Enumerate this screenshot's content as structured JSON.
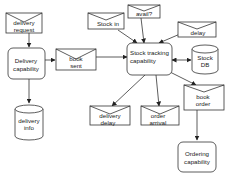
{
  "diagram": {
    "processes": {
      "delivery_capability": {
        "line1": "Delivery",
        "line2": "capability"
      },
      "stock_tracking": {
        "line1": "Stock tracking",
        "line2": "capability"
      },
      "ordering_capability": {
        "line1": "Ordering",
        "line2": "capability"
      }
    },
    "datastores": {
      "delivery_info": {
        "line1": "delivery",
        "line2": "info"
      },
      "stock_db": {
        "line1": "Stock",
        "line2": "DB"
      }
    },
    "messages": {
      "delivery_request": {
        "line1": "delivery",
        "line2": "request"
      },
      "book_sent": {
        "line1": "book",
        "line2": "sent"
      },
      "stock_in": {
        "line1": "Stock in"
      },
      "avail": {
        "line1": "avail?"
      },
      "delay": {
        "line1": "delay"
      },
      "delivery_delay": {
        "line1": "delivery",
        "line2": "delay"
      },
      "order_arrival": {
        "line1": "order",
        "line2": "arrival"
      },
      "book_order": {
        "line1": "book",
        "line2": "order"
      }
    },
    "colors": {
      "stroke": "#333333",
      "fill": "#ffffff",
      "text": "#222222"
    }
  }
}
